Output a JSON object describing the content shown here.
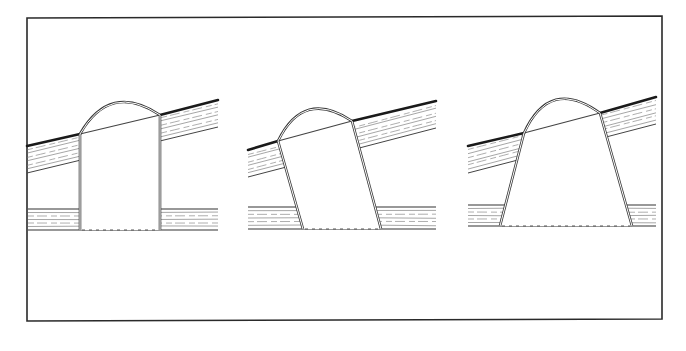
{
  "figure": {
    "colors": {
      "ink": "#2a2a2a",
      "paper": "#ffffff",
      "grain": "#6a6a6a"
    },
    "frame": {
      "points": [
        [
          27,
          18
        ],
        [
          662,
          16
        ],
        [
          662,
          319
        ],
        [
          27,
          321
        ]
      ]
    },
    "panels": [
      {
        "id": "straight-shaft",
        "label": "",
        "roof": {
          "x1": 27,
          "y1": 146,
          "x2": 218,
          "y2": 100,
          "thickness": 27
        },
        "ceiling": {
          "x1": 28,
          "x2": 218,
          "top": 209,
          "bottom": 230
        },
        "dome": {
          "left": [
            80,
            134
          ],
          "right": [
            160,
            115
          ],
          "rise": 22
        },
        "walls": {
          "left_top": [
            80,
            134
          ],
          "left_bottom": [
            80,
            230
          ],
          "right_top": [
            160,
            115
          ],
          "right_bottom": [
            160,
            230
          ]
        }
      },
      {
        "id": "angled-shaft",
        "label": "",
        "roof": {
          "x1": 248,
          "y1": 150,
          "x2": 436,
          "y2": 101,
          "thickness": 27
        },
        "ceiling": {
          "x1": 248,
          "x2": 436,
          "top": 207,
          "bottom": 229
        },
        "dome": {
          "left": [
            278,
            141
          ],
          "right": [
            352,
            121
          ],
          "rise": 22
        },
        "walls": {
          "left_top": [
            278,
            141
          ],
          "left_bottom": [
            303,
            229
          ],
          "right_top": [
            352,
            121
          ],
          "right_bottom": [
            381,
            229
          ]
        }
      },
      {
        "id": "splayed-shaft",
        "label": "",
        "roof": {
          "x1": 468,
          "y1": 146,
          "x2": 656,
          "y2": 97,
          "thickness": 27
        },
        "ceiling": {
          "x1": 468,
          "x2": 656,
          "top": 205,
          "bottom": 226
        },
        "dome": {
          "left": [
            524,
            133
          ],
          "right": [
            600,
            113
          ],
          "rise": 24
        },
        "walls": {
          "left_top": [
            524,
            133
          ],
          "left_bottom": [
            500,
            226
          ],
          "right_top": [
            600,
            113
          ],
          "right_bottom": [
            632,
            226
          ]
        }
      }
    ]
  }
}
